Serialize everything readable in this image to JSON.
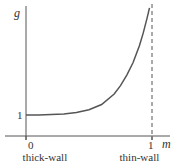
{
  "chart_data": {
    "type": "line",
    "title": "",
    "xlabel": "m",
    "ylabel": "g",
    "x_ticks": [
      {
        "value": 0,
        "label": "0"
      },
      {
        "value": 1,
        "label": "1"
      }
    ],
    "y_ticks": [
      {
        "value": 1,
        "label": "1"
      }
    ],
    "xlim": [
      0,
      1.05
    ],
    "ylim": [
      0,
      6.1
    ],
    "grid": false,
    "annotations": [
      {
        "text": "thick-wall",
        "at_x": 0.15
      },
      {
        "text": "thin-wall",
        "at_x": 0.9
      }
    ],
    "asymptote": {
      "x": 1,
      "style": "dashed"
    },
    "series": [
      {
        "name": "g(m)",
        "x": [
          0,
          0.1,
          0.2,
          0.3,
          0.4,
          0.5,
          0.6,
          0.7,
          0.75,
          0.8,
          0.85,
          0.9,
          0.93,
          0.96,
          0.98
        ],
        "y": [
          1.0,
          1.0,
          1.02,
          1.05,
          1.12,
          1.25,
          1.5,
          2.0,
          2.4,
          2.9,
          3.5,
          4.3,
          4.9,
          5.6,
          6.1
        ]
      }
    ]
  }
}
